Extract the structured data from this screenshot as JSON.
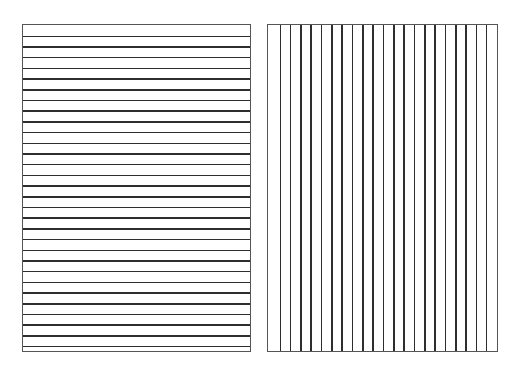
{
  "figure": {
    "line_color": "#2e2e2e",
    "border_color": "#555555",
    "background": "#ffffff",
    "panels": [
      {
        "id": "horizontal-lines-panel",
        "orientation": "horizontal",
        "line_count": 30
      },
      {
        "id": "vertical-lines-panel",
        "orientation": "vertical",
        "line_count": 21
      }
    ]
  }
}
